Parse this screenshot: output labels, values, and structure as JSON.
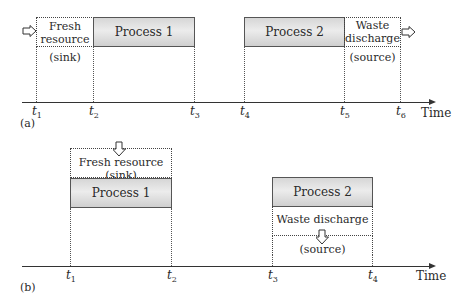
{
  "panel_a": {
    "label": "(a)",
    "fresh_resource": {
      "line1": "Fresh",
      "line2": "resource",
      "sub": "(sink)"
    },
    "process1": "Process 1",
    "process2": "Process 2",
    "waste_discharge": {
      "line1": "Waste",
      "line2": "discharge",
      "sub": "(source)"
    },
    "ticks": [
      "1",
      "2",
      "3",
      "4",
      "5",
      "6"
    ],
    "axis_label": "Time"
  },
  "panel_b": {
    "label": "(b)",
    "fresh_resource": {
      "line1": "Fresh resource",
      "sub": "(sink)"
    },
    "process1": "Process 1",
    "process2": "Process 2",
    "waste_discharge": {
      "line1": "Waste discharge",
      "sub": "(source)"
    },
    "ticks": [
      "1",
      "2",
      "3",
      "4"
    ],
    "axis_label": "Time"
  },
  "tick_prefix": "t"
}
